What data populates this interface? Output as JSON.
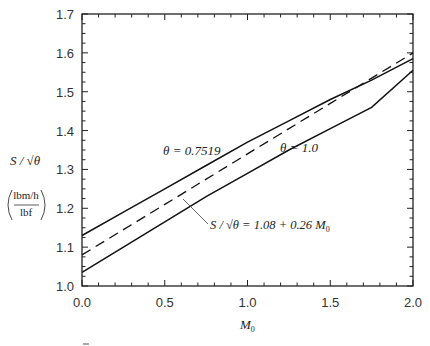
{
  "chart_data": {
    "type": "line",
    "title": "",
    "xlabel": "M0",
    "ylabel": "S/√θ (lbm/h / lbf)",
    "xlim": [
      0.0,
      2.0
    ],
    "ylim": [
      1.0,
      1.7
    ],
    "grid": false,
    "legend": "none (inline annotations)",
    "x_ticks": [
      "0.0",
      "0.5",
      "1.0",
      "1.5",
      "2.0"
    ],
    "y_ticks": [
      "1.0",
      "1.1",
      "1.2",
      "1.3",
      "1.4",
      "1.5",
      "1.6",
      "1.7"
    ],
    "series": [
      {
        "name": "θ = 0.7519",
        "style": "solid",
        "x": [
          0.0,
          0.25,
          0.5,
          0.75,
          1.0,
          1.25,
          1.5,
          1.75,
          2.0
        ],
        "values": [
          1.13,
          1.19,
          1.25,
          1.31,
          1.37,
          1.425,
          1.48,
          1.53,
          1.585
        ]
      },
      {
        "name": "θ = 1.0",
        "style": "solid",
        "x": [
          0.0,
          0.25,
          0.5,
          0.75,
          1.0,
          1.25,
          1.5,
          1.75,
          2.0
        ],
        "values": [
          1.035,
          1.1,
          1.165,
          1.23,
          1.29,
          1.35,
          1.405,
          1.46,
          1.555
        ]
      },
      {
        "name": "S/√θ = 1.08 + 0.26 M0",
        "style": "dashed",
        "x": [
          0.0,
          0.5,
          1.0,
          1.5,
          2.0
        ],
        "values": [
          1.08,
          1.21,
          1.34,
          1.47,
          1.6
        ]
      }
    ],
    "annotations": [
      {
        "text": "θ = 0.7519",
        "x": 0.55,
        "y": 1.345
      },
      {
        "text": "θ = 1.0",
        "x": 1.07,
        "y": 1.3
      },
      {
        "text": "S/√θ = 1.08 + 0.26 M0",
        "x": 0.66,
        "y": 1.175,
        "leader_to": [
          0.6,
          1.225
        ]
      }
    ]
  },
  "axes": {
    "y_label_main": "S / √θ",
    "y_label_unit_num": "lbm/h",
    "y_label_unit_den": "lbf",
    "x_label": "M",
    "x_label_sub": "0"
  },
  "labels": {
    "theta_upper": "θ = 0.7519",
    "theta_lower": "θ = 1.0",
    "formula_lhs": "S / √θ = 1.08 + 0.26 M",
    "formula_sub": "0"
  }
}
